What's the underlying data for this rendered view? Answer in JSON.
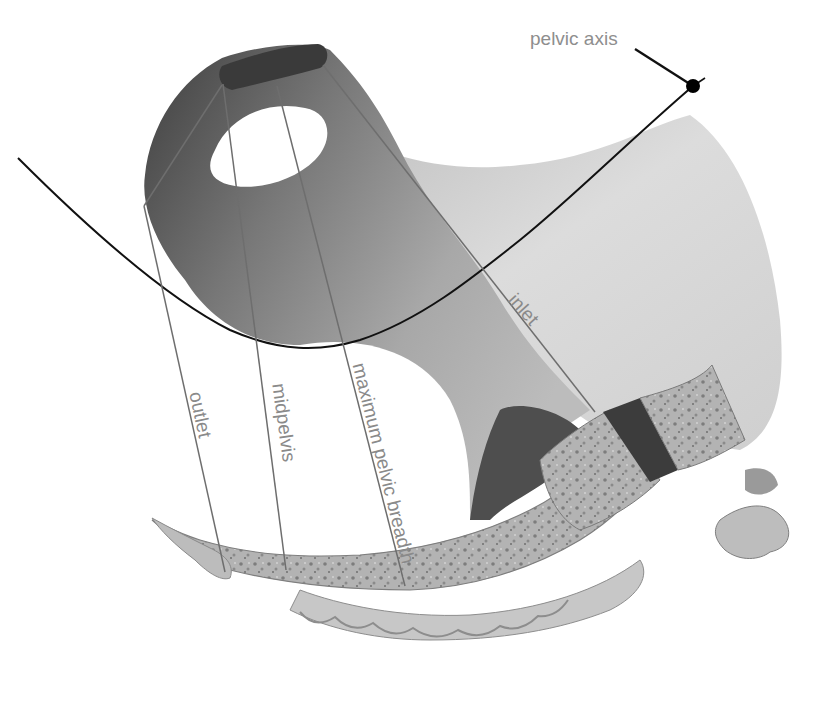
{
  "figure": {
    "labels": {
      "pelvic_axis": "pelvic axis",
      "inlet": "inlet",
      "maximum_pelvic_breadth": "maximum pelvic breadth",
      "midpelvis": "midpelvis",
      "outlet": "outlet"
    },
    "colors": {
      "background": "#ffffff",
      "bone_light": "#d8d8d8",
      "bone_mid": "#a9a9a9",
      "bone_dark": "#4a4a4a",
      "axis_line": "#111111",
      "plane_lines": "#6e6e6e",
      "label_text": "#8a8a8a",
      "highlight_block": "#3c3c3c"
    },
    "axis_marker": "filled-circle"
  }
}
